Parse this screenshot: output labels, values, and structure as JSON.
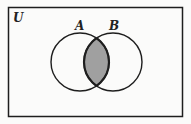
{
  "diagram": {
    "type": "venn",
    "universe_label": "U",
    "sets": [
      {
        "label": "A",
        "cx": 80,
        "cy": 62,
        "r": 29
      },
      {
        "label": "B",
        "cx": 113,
        "cy": 62,
        "r": 29
      }
    ],
    "shaded_region": "A ∩ B",
    "colors": {
      "background": "#fbfbfa",
      "stroke": "#1e1e1e",
      "shade": "#a0a0a0"
    }
  }
}
